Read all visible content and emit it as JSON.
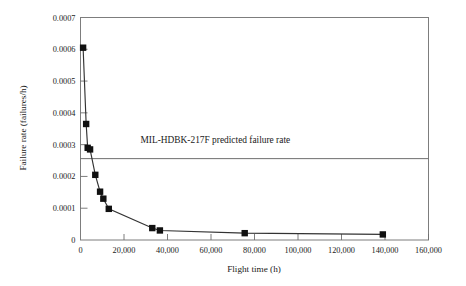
{
  "chart_data": {
    "type": "scatter",
    "title": "",
    "xlabel": "Flight time (h)",
    "ylabel": "Failure rate (failures/h)",
    "xlim": [
      0,
      160000
    ],
    "ylim": [
      0,
      0.0007
    ],
    "grid": false,
    "legend": "none",
    "xticks": [
      0,
      20000,
      40000,
      60000,
      80000,
      100000,
      120000,
      140000,
      160000
    ],
    "xtick_labels": [
      "0",
      "20,000",
      "40,000",
      "60,000",
      "80,000",
      "100,000",
      "120,000",
      "140,000",
      "160,000"
    ],
    "yticks": [
      0,
      0.0001,
      0.0002,
      0.0003,
      0.0004,
      0.0005,
      0.0006,
      0.0007
    ],
    "ytick_labels": [
      "0",
      "0.0001",
      "0.0002",
      "0.0003",
      "0.0004",
      "0.0005",
      "0.0006",
      "0.0007"
    ],
    "series": [
      {
        "name": "Observed failure rate",
        "marker": "square",
        "marker_color": "#111111",
        "line_color": "#333333",
        "x": [
          1200,
          2600,
          3300,
          4400,
          6800,
          9000,
          10500,
          13000,
          33000,
          36500,
          75500,
          139000
        ],
        "y": [
          0.000605,
          0.000365,
          0.00029,
          0.000285,
          0.000205,
          0.000152,
          0.00013,
          9.8e-05,
          3.75e-05,
          3e-05,
          2.15e-05,
          1.75e-05
        ]
      }
    ],
    "annotations": [
      {
        "name": "mil-hdbk-reference-line",
        "text": "MIL-HDBK-217F predicted failure rate",
        "type": "horizontal-line-with-label",
        "y_value": 0.000256,
        "line_color": "#6e6e6e",
        "label_x": 62000,
        "label_y": 0.000305
      }
    ]
  }
}
